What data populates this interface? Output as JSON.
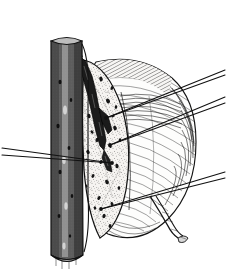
{
  "figure": {
    "title": "Longitudinal section of a stem gall",
    "medium": "black-and-white stipple and line engraving",
    "background_color": "#ffffff",
    "ink_color": "#1a1a1a",
    "canvas": {
      "width": 227,
      "height": 274
    },
    "visible_text": "",
    "label_text_present": false
  },
  "subjects": {
    "stem": {
      "name": "woody stem",
      "orientation": "vertical",
      "rendering": "dense horizontal hatching suggesting bark cylinder",
      "x_left": 50,
      "x_right": 83,
      "y_top": 41,
      "y_bottom": 262,
      "cut_top": true,
      "cut_bottom": true,
      "fill_color": "#8c8c8c"
    },
    "gall_body": {
      "name": "gall outer body",
      "shape": "ovoid swelling attached to stem",
      "rendering": "curved contour hatching with light interior",
      "fill_color": "#fbfbfb",
      "shade_color": "#4a4a4a"
    },
    "cut_face": {
      "name": "sectioned face of gall",
      "shape": "pointed lens / almond outline",
      "rendering": "fine stipple with scattered dark flecks",
      "fill_color": "#f4f4f4",
      "stipple_color": "#2b2b2b",
      "fleck_count": 26
    },
    "larval_tunnel": {
      "name": "larval tunnel",
      "rendering": "dark irregular diagonal channel through gall tissue",
      "color": "#1c1c1c",
      "runs_from": "upper attachment point near stem",
      "runs_to": "mid-lower cut face"
    },
    "pedicel": {
      "name": "pedicel stalk tip",
      "rendering": "short curved tapering stalk at lower right of gall",
      "color": "#2a2a2a"
    }
  },
  "leader_lines": {
    "stroke_color": "#111111",
    "stroke_width": 1.1,
    "items": [
      {
        "id": "leader-1",
        "side": "left",
        "x1": 2,
        "y1": 148,
        "x2": 112,
        "y2": 163,
        "terminator": "dot"
      },
      {
        "id": "leader-2",
        "side": "left",
        "x1": 2,
        "y1": 155,
        "x2": 112,
        "y2": 163,
        "terminator": "none"
      },
      {
        "id": "leader-3",
        "side": "right",
        "x1": 225,
        "y1": 70,
        "x2": 106,
        "y2": 118,
        "terminator": "dot"
      },
      {
        "id": "leader-4",
        "side": "right",
        "x1": 225,
        "y1": 75,
        "x2": 106,
        "y2": 118,
        "terminator": "none"
      },
      {
        "id": "leader-5",
        "side": "right",
        "x1": 225,
        "y1": 97,
        "x2": 110,
        "y2": 145,
        "terminator": "dot"
      },
      {
        "id": "leader-6",
        "side": "right",
        "x1": 225,
        "y1": 103,
        "x2": 110,
        "y2": 145,
        "terminator": "none"
      },
      {
        "id": "leader-7",
        "side": "right",
        "x1": 225,
        "y1": 172,
        "x2": 101,
        "y2": 209,
        "terminator": "dot"
      },
      {
        "id": "leader-8",
        "side": "right",
        "x1": 225,
        "y1": 178,
        "x2": 101,
        "y2": 209,
        "terminator": "none"
      }
    ]
  },
  "chart_data": {
    "type": "table",
    "title": "Longitudinal section of a stem gall",
    "xlabel": "",
    "ylabel": "",
    "categories": [
      "stem",
      "gall body",
      "cut face",
      "larval tunnel",
      "pedicel"
    ],
    "values": [
      1,
      1,
      1,
      1,
      1
    ],
    "annotations": [
      "vertical woody stem, hatched, cut at both ends",
      "ovoid gall attached to the right side of the stem",
      "gall cut open showing stippled inner tissue",
      "dark larval tunnel running diagonally through tissue",
      "small curved pedicel at lower right",
      "eight unlabeled leader lines radiating to image edges"
    ]
  }
}
